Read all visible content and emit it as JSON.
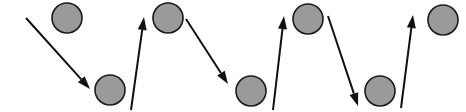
{
  "canvas": {
    "width": 466,
    "height": 112,
    "background": "#ffffff"
  },
  "style": {
    "node_fill": "#9a9a9a",
    "node_stroke": "#1a1a1a",
    "node_stroke_width": 1.6,
    "node_radius": 15,
    "arrow_color": "#111111",
    "arrow_stroke_width": 2.0,
    "arrow_head_length": 13,
    "arrow_head_width": 9
  },
  "diagram": {
    "type": "node-arrow-zigzag",
    "node_count": 7,
    "arrow_count": 6,
    "row_positions": {
      "top_cy": 19,
      "bottom_cy": 90
    }
  },
  "nodes": [
    {
      "id": "node-1",
      "label": "",
      "row": "top",
      "cx": 67,
      "cy": 18
    },
    {
      "id": "node-2",
      "label": "",
      "row": "bottom",
      "cx": 110,
      "cy": 90
    },
    {
      "id": "node-3",
      "label": "",
      "row": "top",
      "cx": 168,
      "cy": 18
    },
    {
      "id": "node-4",
      "label": "",
      "row": "bottom",
      "cx": 251,
      "cy": 91
    },
    {
      "id": "node-5",
      "label": "",
      "row": "top",
      "cx": 308,
      "cy": 19
    },
    {
      "id": "node-6",
      "label": "",
      "row": "bottom",
      "cx": 380,
      "cy": 91
    },
    {
      "id": "node-7",
      "label": "",
      "row": "top",
      "cx": 443,
      "cy": 20
    }
  ],
  "arrows": [
    {
      "id": "arrow-1",
      "direction": "down-right",
      "x1": 26,
      "y1": 18,
      "x2": 90,
      "y2": 89
    },
    {
      "id": "arrow-2",
      "direction": "up-right",
      "x1": 131,
      "y1": 110,
      "x2": 144,
      "y2": 17
    },
    {
      "id": "arrow-3",
      "direction": "down-right",
      "x1": 186,
      "y1": 19,
      "x2": 228,
      "y2": 84
    },
    {
      "id": "arrow-4",
      "direction": "up-right",
      "x1": 273,
      "y1": 110,
      "x2": 284,
      "y2": 16
    },
    {
      "id": "arrow-5",
      "direction": "down-right",
      "x1": 328,
      "y1": 16,
      "x2": 358,
      "y2": 106
    },
    {
      "id": "arrow-6",
      "direction": "up-right",
      "x1": 401,
      "y1": 108,
      "x2": 413,
      "y2": 15
    }
  ]
}
